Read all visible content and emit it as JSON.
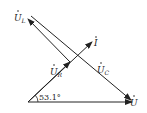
{
  "diagram": {
    "type": "phasor-diagram",
    "labels": {
      "UL": {
        "main": "U",
        "sub": "L"
      },
      "UR": {
        "main": "U",
        "sub": "R"
      },
      "UC": {
        "main": "U",
        "sub": "C"
      },
      "U": {
        "main": "U"
      },
      "I": {
        "main": "I"
      }
    },
    "angle": "53.1°",
    "colors": {
      "stroke": "#222222",
      "background": "#ffffff"
    }
  }
}
